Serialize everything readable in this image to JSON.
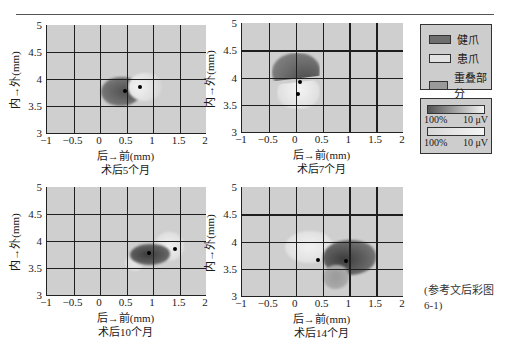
{
  "figure": {
    "legend": {
      "items": [
        {
          "label": "健爪",
          "color": "#6e6e6e"
        },
        {
          "label": "患爪",
          "color": "#e2e2e2"
        },
        {
          "label": "重叠部分",
          "color": "#9a9a9a"
        }
      ],
      "scales": [
        {
          "left": "100%",
          "right": "10 μV",
          "from": "#555555",
          "to": "#f2f2f2"
        },
        {
          "left": "100%",
          "right": "10 μV",
          "from": "#d8d8d8",
          "to": "#f4f4f4"
        }
      ]
    },
    "note": {
      "line1": "(参考文后彩图",
      "line2": "6-1)"
    }
  },
  "chart_data": [
    {
      "type": "heatmap",
      "title": "术后5个月",
      "xlabel": "后→前(mm)",
      "ylabel": "内→外(mm)",
      "xlim": [
        -1,
        2
      ],
      "ylim": [
        3,
        5
      ],
      "xticks": [
        "-1",
        "-0.5",
        "0",
        "0.5",
        "1",
        "1.5",
        "2"
      ],
      "yticks": [
        "3",
        "3.5",
        "4",
        "4.5",
        "5"
      ],
      "grid": true,
      "series": [
        {
          "name": "健爪",
          "center": [
            0.47,
            3.77
          ]
        },
        {
          "name": "患爪",
          "center": [
            0.75,
            3.85
          ]
        }
      ]
    },
    {
      "type": "heatmap",
      "title": "术后7个月",
      "xlabel": "后→前(mm)",
      "ylabel": "内→外(mm)",
      "xlim": [
        -1,
        2
      ],
      "ylim": [
        3,
        5
      ],
      "xticks": [
        "-1",
        "-0.5",
        "0",
        "0.5",
        "1",
        "1.5",
        "2"
      ],
      "yticks": [
        "3",
        "3.5",
        "4",
        "4.5",
        "5"
      ],
      "grid": true,
      "series": [
        {
          "name": "健爪",
          "center": [
            0.08,
            3.92
          ]
        },
        {
          "name": "患爪",
          "center": [
            0.05,
            3.7
          ]
        }
      ]
    },
    {
      "type": "heatmap",
      "title": "术后10个月",
      "xlabel": "后→前(mm)",
      "ylabel": "内→外(mm)",
      "xlim": [
        -1,
        2
      ],
      "ylim": [
        3,
        5
      ],
      "xticks": [
        "-1",
        "-0.5",
        "0",
        "0.5",
        "1",
        "1.5",
        "2"
      ],
      "yticks": [
        "3",
        "3.5",
        "4",
        "4.5",
        "5"
      ],
      "grid": true,
      "series": [
        {
          "name": "健爪",
          "center": [
            0.92,
            3.78
          ]
        },
        {
          "name": "患爪",
          "center": [
            1.42,
            3.85
          ]
        }
      ]
    },
    {
      "type": "heatmap",
      "title": "术后14个月",
      "xlabel": "后→前(mm)",
      "ylabel": "内→外(mm)",
      "xlim": [
        -1,
        2
      ],
      "ylim": [
        3,
        5
      ],
      "xticks": [
        "-1",
        "-0.5",
        "0",
        "0.5",
        "1",
        "1.5",
        "2"
      ],
      "yticks": [
        "3",
        "3.5",
        "4",
        "4.5",
        "5"
      ],
      "grid": true,
      "series": [
        {
          "name": "健爪",
          "center": [
            0.93,
            3.65
          ]
        },
        {
          "name": "患爪",
          "center": [
            0.42,
            3.66
          ]
        }
      ]
    }
  ]
}
